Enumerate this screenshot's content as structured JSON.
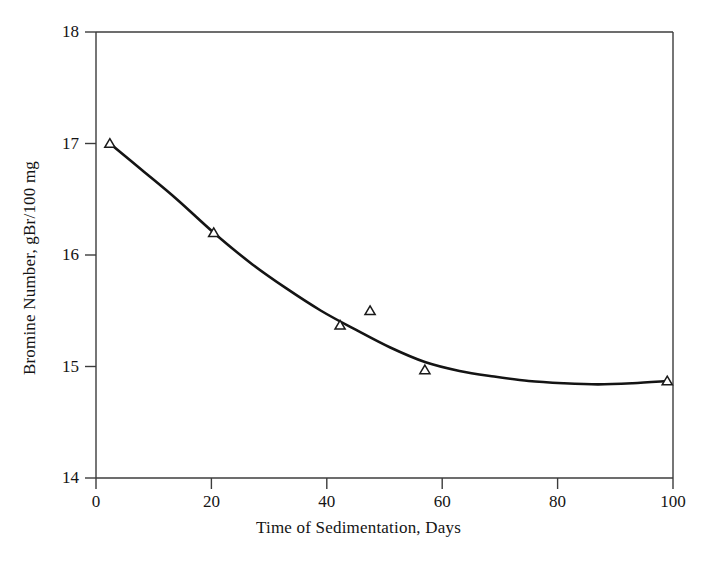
{
  "chart_data": {
    "type": "line",
    "title": "",
    "subtitle": "",
    "xlabel": "Time of Sedimentation, Days",
    "ylabel": "Bromine Number, gBr/100 mg",
    "xlim": [
      0,
      100
    ],
    "ylim": [
      14,
      18
    ],
    "xticks": [
      0,
      20,
      40,
      60,
      80,
      100
    ],
    "xtick_labels": [
      "0",
      "20",
      "40",
      "60",
      "80",
      "100"
    ],
    "yticks": [
      14,
      15,
      16,
      17,
      18
    ],
    "ytick_labels": [
      "14",
      "15",
      "16",
      "17",
      "18"
    ],
    "grid": false,
    "legend": "none",
    "series": [
      {
        "name": "Bromine number (measured)",
        "marker": "open-triangle",
        "marker_color": "#1a1a1a",
        "line": "none",
        "x": [
          2.4,
          20.4,
          42.3,
          47.5,
          57.0,
          99.0
        ],
        "y": [
          17.0,
          16.2,
          15.37,
          15.5,
          14.97,
          14.87
        ]
      },
      {
        "name": "Fitted trend curve",
        "marker": "none",
        "line": "solid",
        "line_color": "#141414",
        "line_width": 2.6,
        "x": [
          2.4,
          8,
          14,
          20.4,
          27,
          33,
          39,
          45,
          51,
          57,
          63,
          69,
          75,
          81,
          87,
          93,
          99
        ],
        "y": [
          17.0,
          16.76,
          16.5,
          16.2,
          15.92,
          15.7,
          15.5,
          15.33,
          15.17,
          15.04,
          14.96,
          14.91,
          14.87,
          14.85,
          14.84,
          14.85,
          14.87
        ]
      }
    ]
  },
  "axes": {
    "frame_color": "#3c3c3c",
    "tick_color": "#3c3c3c",
    "background": "#ffffff"
  }
}
